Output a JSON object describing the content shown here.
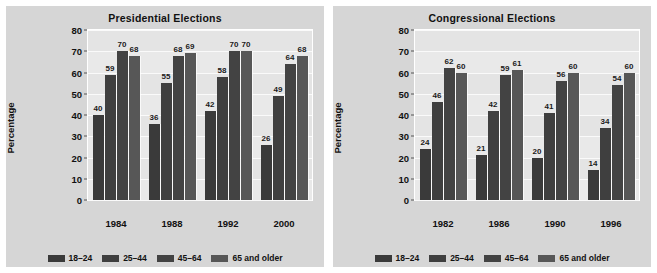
{
  "figure": {
    "background": "#ffffff",
    "panel_background": "#d6d6d6",
    "plot_background": "#e9e9e9"
  },
  "series_colors": [
    "#3a3a3a",
    "#3f3f3f",
    "#434343",
    "#575757"
  ],
  "chart_data": [
    {
      "type": "bar",
      "title": "Presidential Elections",
      "xlabel": "",
      "ylabel": "Percentage",
      "ylim": [
        0,
        80
      ],
      "yticks": [
        0,
        10,
        20,
        30,
        40,
        50,
        60,
        70,
        80
      ],
      "grid": true,
      "legend_position": "bottom",
      "categories": [
        "1984",
        "1988",
        "1992",
        "2000"
      ],
      "series": [
        {
          "name": "18–24",
          "values": [
            40,
            36,
            42,
            26
          ]
        },
        {
          "name": "25–44",
          "values": [
            59,
            55,
            58,
            49
          ]
        },
        {
          "name": "45–64",
          "values": [
            70,
            68,
            70,
            64
          ]
        },
        {
          "name": "65 and older",
          "values": [
            68,
            69,
            70,
            68
          ]
        }
      ]
    },
    {
      "type": "bar",
      "title": "Congressional Elections",
      "xlabel": "",
      "ylabel": "Percentage",
      "ylim": [
        0,
        80
      ],
      "yticks": [
        0,
        10,
        20,
        30,
        40,
        50,
        60,
        70,
        80
      ],
      "grid": true,
      "legend_position": "bottom",
      "categories": [
        "1982",
        "1986",
        "1990",
        "1996"
      ],
      "series": [
        {
          "name": "18–24",
          "values": [
            24,
            21,
            20,
            14
          ]
        },
        {
          "name": "25–44",
          "values": [
            46,
            42,
            41,
            34
          ]
        },
        {
          "name": "45–64",
          "values": [
            62,
            59,
            56,
            54
          ]
        },
        {
          "name": "65 and older",
          "values": [
            60,
            61,
            60,
            60
          ]
        }
      ]
    }
  ]
}
